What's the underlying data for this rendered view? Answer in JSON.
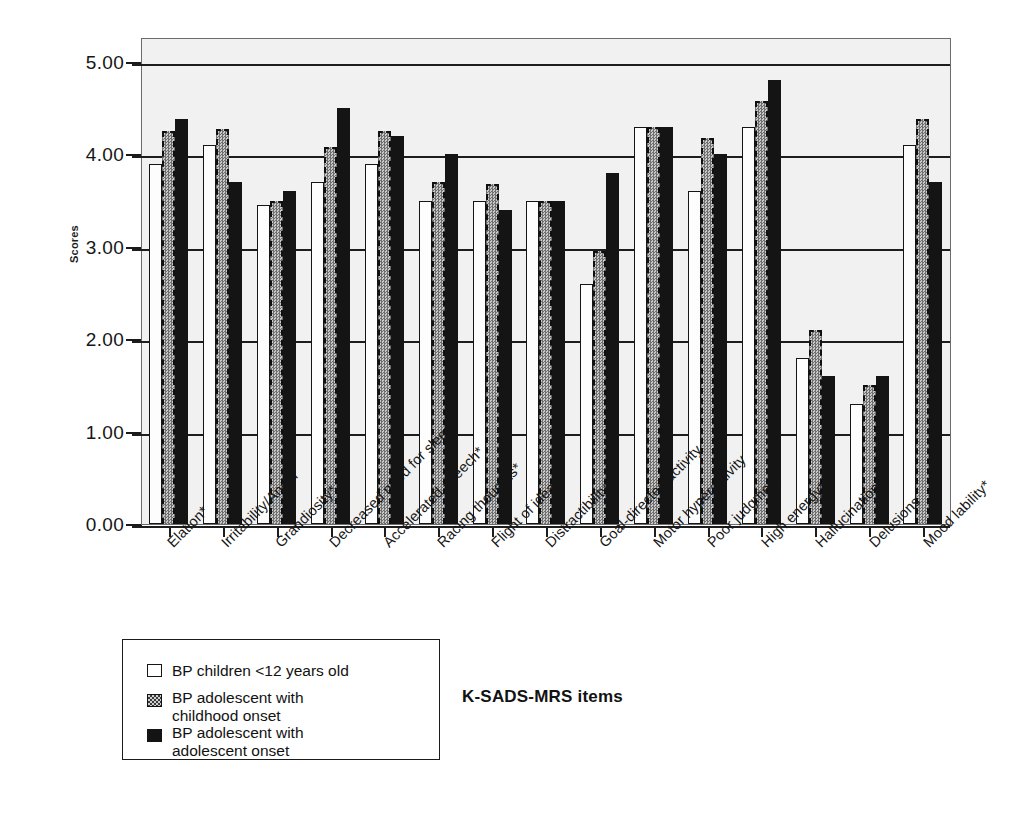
{
  "chart_data": {
    "type": "bar",
    "title": "",
    "xlabel": "K-SADS-MRS items",
    "ylabel": "Scores",
    "ylim": [
      0,
      5
    ],
    "yticks": [
      "0.00",
      "1.00",
      "2.00",
      "3.00",
      "4.00",
      "5.00"
    ],
    "grid": true,
    "legend_position": "bottom-left",
    "categories": [
      "Elation*",
      "Irritability/Anger",
      "Grandiosity*",
      "Decreased need for sleep*",
      "Accelerated speech*",
      "Racing thoughts*",
      "Flight of ideas*",
      "Distractibility",
      "Goal-directed activity",
      "Motor hyperactivity",
      "Poor judgment*",
      "High energy*",
      "Hallucinations",
      "Delusions",
      "Mood lability*"
    ],
    "category_lines": [
      [
        "Elation*"
      ],
      [
        "Irritability/Anger"
      ],
      [
        "Grandiosity*"
      ],
      [
        "Decreased need for sleep*"
      ],
      [
        "Accelerated speech*"
      ],
      [
        "Racing thoughts*"
      ],
      [
        "Flight of ideas*"
      ],
      [
        "Distractibility"
      ],
      [
        "Goal-directed activity"
      ],
      [
        "Motor hyperactivity"
      ],
      [
        "Poor judgment*"
      ],
      [
        "High energy*"
      ],
      [
        "Hallucinations"
      ],
      [
        "Delusions"
      ],
      [
        "Mood lability*"
      ]
    ],
    "series": [
      {
        "name": "BP children <12 years old",
        "legend_lines": [
          "BP children <12 years old"
        ],
        "style": "white-outline",
        "color": "#ffffff",
        "values": [
          3.9,
          4.1,
          3.45,
          3.7,
          3.9,
          3.5,
          3.5,
          3.5,
          2.6,
          4.3,
          3.6,
          4.3,
          1.8,
          1.3,
          4.1
        ]
      },
      {
        "name": "BP adolescent with childhood onset",
        "legend_lines": [
          "BP adolescent with",
          "childhood onset"
        ],
        "style": "gray-checkered-dashed",
        "color": "#9a9a9a",
        "values": [
          4.25,
          4.28,
          3.5,
          4.08,
          4.25,
          3.7,
          3.68,
          3.5,
          2.95,
          4.3,
          4.18,
          4.58,
          2.1,
          1.5,
          4.38
        ]
      },
      {
        "name": "BP adolescent with adolescent onset",
        "legend_lines": [
          "BP adolescent with",
          "adolescent onset"
        ],
        "style": "black-solid",
        "color": "#141414",
        "values": [
          4.38,
          3.7,
          3.6,
          4.5,
          4.2,
          4.0,
          3.4,
          3.5,
          3.8,
          4.3,
          4.0,
          4.8,
          1.6,
          1.6,
          3.7
        ]
      }
    ]
  }
}
